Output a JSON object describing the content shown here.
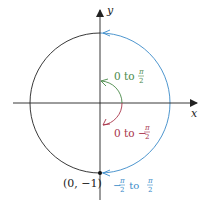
{
  "axes": {
    "x_label": "x",
    "y_label": "y"
  },
  "point": {
    "label": "(0, −1)"
  },
  "arcs": {
    "green": {
      "prefix": "0 to ",
      "num": "π",
      "den": "2",
      "color": "#4a8a4a"
    },
    "red": {
      "prefix": "0 to −",
      "num": "π",
      "den": "2",
      "color": "#a8344a"
    },
    "blue": {
      "neg": "−",
      "num1": "π",
      "den1": "2",
      "mid": " to ",
      "num2": "π",
      "den2": "2",
      "color": "#3a8ac8"
    }
  },
  "colors": {
    "axis": "#222222",
    "circle": "#222222"
  }
}
